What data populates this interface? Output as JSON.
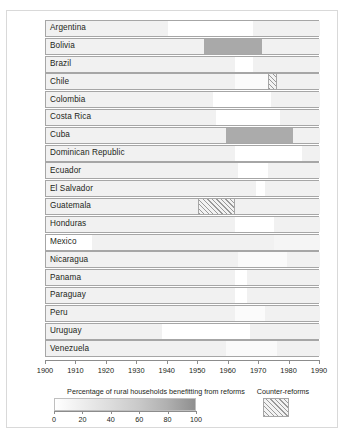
{
  "chart_data": {
    "type": "heatmap",
    "title": "",
    "xlabel": "",
    "ylabel": "",
    "xlim": [
      1900,
      1990
    ],
    "grid": false,
    "legend_position": "bottom",
    "value_label": "Percentage of rural households benefitting from reforms",
    "value_scale": {
      "min": 0,
      "max": 100,
      "ticks": [
        0,
        20,
        40,
        60,
        80,
        100
      ]
    },
    "counter_reform_label": "Counter-reforms",
    "x_ticks": [
      1900,
      1910,
      1920,
      1930,
      1940,
      1950,
      1960,
      1970,
      1980,
      1990
    ],
    "categories": [
      "Argentina",
      "Bolivia",
      "Brazil",
      "Chile",
      "Colombia",
      "Costa Rica",
      "Cuba",
      "Dominican Republic",
      "Ecuador",
      "El Salvador",
      "Guatemala",
      "Honduras",
      "Mexico",
      "Nicaragua",
      "Panama",
      "Paraguay",
      "Peru",
      "Uruguay",
      "Venezuela"
    ],
    "series": [
      {
        "name": "Argentina",
        "segments": [
          {
            "start": 1900,
            "end": 1940,
            "value": 12,
            "type": "reform"
          },
          {
            "start": 1940,
            "end": 1968,
            "value": 0,
            "type": "reform"
          },
          {
            "start": 1968,
            "end": 1990,
            "value": 12,
            "type": "reform"
          }
        ]
      },
      {
        "name": "Bolivia",
        "segments": [
          {
            "start": 1900,
            "end": 1952,
            "value": 12,
            "type": "reform"
          },
          {
            "start": 1952,
            "end": 1971,
            "value": 72,
            "type": "reform"
          },
          {
            "start": 1971,
            "end": 1990,
            "value": 12,
            "type": "reform"
          }
        ]
      },
      {
        "name": "Brazil",
        "segments": [
          {
            "start": 1900,
            "end": 1962,
            "value": 12,
            "type": "reform"
          },
          {
            "start": 1962,
            "end": 1968,
            "value": 0,
            "type": "reform"
          },
          {
            "start": 1968,
            "end": 1990,
            "value": 12,
            "type": "reform"
          }
        ]
      },
      {
        "name": "Chile",
        "segments": [
          {
            "start": 1900,
            "end": 1962,
            "value": 12,
            "type": "reform"
          },
          {
            "start": 1962,
            "end": 1973,
            "value": 3,
            "type": "reform"
          },
          {
            "start": 1973,
            "end": 1976,
            "value": 0,
            "type": "counter-reform"
          },
          {
            "start": 1976,
            "end": 1990,
            "value": 12,
            "type": "reform"
          }
        ]
      },
      {
        "name": "Colombia",
        "segments": [
          {
            "start": 1900,
            "end": 1955,
            "value": 12,
            "type": "reform"
          },
          {
            "start": 1955,
            "end": 1974,
            "value": 0,
            "type": "reform"
          },
          {
            "start": 1974,
            "end": 1990,
            "value": 12,
            "type": "reform"
          }
        ]
      },
      {
        "name": "Costa Rica",
        "segments": [
          {
            "start": 1900,
            "end": 1956,
            "value": 12,
            "type": "reform"
          },
          {
            "start": 1956,
            "end": 1977,
            "value": 0,
            "type": "reform"
          },
          {
            "start": 1977,
            "end": 1990,
            "value": 12,
            "type": "reform"
          }
        ]
      },
      {
        "name": "Cuba",
        "segments": [
          {
            "start": 1900,
            "end": 1959,
            "value": 12,
            "type": "reform"
          },
          {
            "start": 1959,
            "end": 1981,
            "value": 70,
            "type": "reform"
          },
          {
            "start": 1981,
            "end": 1990,
            "value": 12,
            "type": "reform"
          }
        ]
      },
      {
        "name": "Dominican Republic",
        "segments": [
          {
            "start": 1900,
            "end": 1962,
            "value": 12,
            "type": "reform"
          },
          {
            "start": 1962,
            "end": 1984,
            "value": 0,
            "type": "reform"
          },
          {
            "start": 1984,
            "end": 1990,
            "value": 12,
            "type": "reform"
          }
        ]
      },
      {
        "name": "Ecuador",
        "segments": [
          {
            "start": 1900,
            "end": 1963,
            "value": 12,
            "type": "reform"
          },
          {
            "start": 1963,
            "end": 1973,
            "value": 0,
            "type": "reform"
          },
          {
            "start": 1973,
            "end": 1990,
            "value": 12,
            "type": "reform"
          }
        ]
      },
      {
        "name": "El Salvador",
        "segments": [
          {
            "start": 1900,
            "end": 1969,
            "value": 12,
            "type": "reform"
          },
          {
            "start": 1969,
            "end": 1972,
            "value": 0,
            "type": "reform"
          },
          {
            "start": 1972,
            "end": 1990,
            "value": 12,
            "type": "reform"
          }
        ]
      },
      {
        "name": "Guatemala",
        "segments": [
          {
            "start": 1900,
            "end": 1950,
            "value": 12,
            "type": "reform"
          },
          {
            "start": 1950,
            "end": 1962,
            "value": 0,
            "type": "counter-reform"
          },
          {
            "start": 1962,
            "end": 1990,
            "value": 12,
            "type": "reform"
          }
        ]
      },
      {
        "name": "Honduras",
        "segments": [
          {
            "start": 1900,
            "end": 1962,
            "value": 12,
            "type": "reform"
          },
          {
            "start": 1962,
            "end": 1975,
            "value": 0,
            "type": "reform"
          },
          {
            "start": 1975,
            "end": 1990,
            "value": 12,
            "type": "reform"
          }
        ]
      },
      {
        "name": "Mexico",
        "segments": [
          {
            "start": 1900,
            "end": 1915,
            "value": 0,
            "type": "reform"
          },
          {
            "start": 1915,
            "end": 1975,
            "value": 12,
            "type": "reform"
          },
          {
            "start": 1975,
            "end": 1990,
            "value": 8,
            "type": "reform"
          }
        ]
      },
      {
        "name": "Nicaragua",
        "segments": [
          {
            "start": 1900,
            "end": 1963,
            "value": 12,
            "type": "reform"
          },
          {
            "start": 1963,
            "end": 1979,
            "value": 4,
            "type": "reform"
          },
          {
            "start": 1979,
            "end": 1990,
            "value": 12,
            "type": "reform"
          }
        ]
      },
      {
        "name": "Panama",
        "segments": [
          {
            "start": 1900,
            "end": 1962,
            "value": 12,
            "type": "reform"
          },
          {
            "start": 1962,
            "end": 1966,
            "value": 0,
            "type": "reform"
          },
          {
            "start": 1966,
            "end": 1990,
            "value": 12,
            "type": "reform"
          }
        ]
      },
      {
        "name": "Paraguay",
        "segments": [
          {
            "start": 1900,
            "end": 1962,
            "value": 12,
            "type": "reform"
          },
          {
            "start": 1962,
            "end": 1966,
            "value": 0,
            "type": "reform"
          },
          {
            "start": 1966,
            "end": 1990,
            "value": 12,
            "type": "reform"
          }
        ]
      },
      {
        "name": "Peru",
        "segments": [
          {
            "start": 1900,
            "end": 1962,
            "value": 12,
            "type": "reform"
          },
          {
            "start": 1962,
            "end": 1972,
            "value": 3,
            "type": "reform"
          },
          {
            "start": 1972,
            "end": 1990,
            "value": 12,
            "type": "reform"
          }
        ]
      },
      {
        "name": "Uruguay",
        "segments": [
          {
            "start": 1900,
            "end": 1938,
            "value": 12,
            "type": "reform"
          },
          {
            "start": 1938,
            "end": 1967,
            "value": 0,
            "type": "reform"
          },
          {
            "start": 1967,
            "end": 1990,
            "value": 12,
            "type": "reform"
          }
        ]
      },
      {
        "name": "Venezuela",
        "segments": [
          {
            "start": 1900,
            "end": 1959,
            "value": 12,
            "type": "reform"
          },
          {
            "start": 1959,
            "end": 1976,
            "value": 4,
            "type": "reform"
          },
          {
            "start": 1976,
            "end": 1990,
            "value": 12,
            "type": "reform"
          }
        ]
      }
    ]
  }
}
